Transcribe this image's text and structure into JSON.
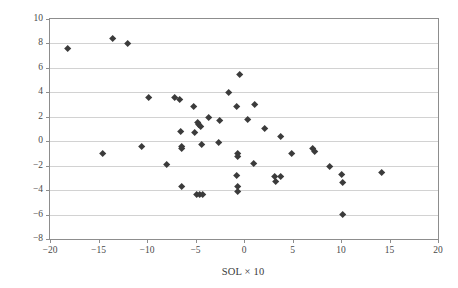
{
  "chart_data": {
    "type": "scatter",
    "title": "",
    "xlabel": "SOL × 10",
    "ylabel": "Anamoly (in.)",
    "xlim": [
      -20,
      20
    ],
    "ylim": [
      -8,
      10
    ],
    "xticks": [
      -20,
      -15,
      -10,
      -5,
      0,
      5,
      10,
      15,
      20
    ],
    "yticks": [
      -8,
      -6,
      -4,
      -2,
      0,
      2,
      4,
      6,
      8,
      10
    ],
    "xtick_labels": [
      "−20",
      "−15",
      "−10",
      "−5",
      "0",
      "5",
      "10",
      "15",
      "20"
    ],
    "ytick_labels": [
      "−8",
      "−6",
      "−4",
      "−2",
      "0",
      "2",
      "4",
      "6",
      "8",
      "10"
    ],
    "grid": "horizontal",
    "legend": "none",
    "marker": "diamond",
    "marker_color": "#3b3b3b",
    "series": [
      {
        "name": "Anamoly vs SOL",
        "points": [
          [
            -18.2,
            7.6
          ],
          [
            -13.5,
            8.4
          ],
          [
            -12.0,
            7.95
          ],
          [
            -14.6,
            -1.05
          ],
          [
            -9.8,
            3.55
          ],
          [
            -10.5,
            -0.45
          ],
          [
            -8.0,
            -1.95
          ],
          [
            -7.1,
            3.6
          ],
          [
            -6.6,
            3.4
          ],
          [
            -6.5,
            0.75
          ],
          [
            -6.45,
            -0.45
          ],
          [
            -6.4,
            -0.6
          ],
          [
            -6.4,
            -3.75
          ],
          [
            -5.2,
            2.8
          ],
          [
            -5.1,
            0.7
          ],
          [
            -4.75,
            1.5
          ],
          [
            -4.65,
            1.35
          ],
          [
            -4.5,
            1.2
          ],
          [
            -4.4,
            -0.3
          ],
          [
            -4.9,
            -4.4
          ],
          [
            -4.55,
            -4.4
          ],
          [
            -4.25,
            -4.4
          ],
          [
            -3.6,
            1.9
          ],
          [
            -2.55,
            1.7
          ],
          [
            -2.6,
            -0.15
          ],
          [
            -1.6,
            4.0
          ],
          [
            -0.45,
            5.45
          ],
          [
            -0.75,
            2.85
          ],
          [
            -0.6,
            -1.05
          ],
          [
            -0.65,
            -1.25
          ],
          [
            -0.75,
            -2.8
          ],
          [
            -0.65,
            -3.75
          ],
          [
            -0.65,
            -4.15
          ],
          [
            0.35,
            1.8
          ],
          [
            1.15,
            3.0
          ],
          [
            1.05,
            -1.85
          ],
          [
            2.1,
            1.05
          ],
          [
            3.15,
            -2.9
          ],
          [
            3.3,
            -3.35
          ],
          [
            3.75,
            -2.9
          ],
          [
            3.8,
            0.4
          ],
          [
            4.95,
            -1.0
          ],
          [
            7.1,
            -0.65
          ],
          [
            7.25,
            -0.85
          ],
          [
            8.8,
            -2.05
          ],
          [
            10.1,
            -2.75
          ],
          [
            10.2,
            -3.4
          ],
          [
            10.15,
            -6.05
          ],
          [
            14.2,
            -2.55
          ]
        ]
      }
    ]
  }
}
